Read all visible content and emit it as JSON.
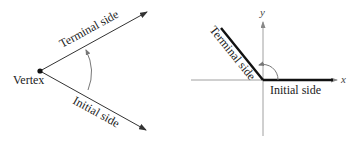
{
  "left_figure": {
    "vertex_label": "Vertex",
    "terminal_label": "Terminal side",
    "initial_label": "Initial side"
  },
  "right_figure": {
    "x_axis_label": "x",
    "y_axis_label": "y",
    "terminal_label": "Terminal side",
    "initial_label": "Initial side"
  },
  "colors": {
    "line": "#333333",
    "thick_line": "#111111",
    "arc": "#777777",
    "axis": "#888888"
  }
}
